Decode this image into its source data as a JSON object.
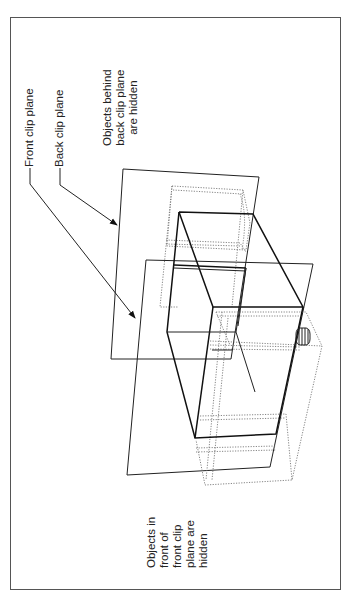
{
  "figure": {
    "labels": {
      "front_clip_plane": "Front clip plane",
      "back_clip_plane": "Back clip plane",
      "behind_note": [
        "Objects behind",
        "back clip plane",
        "are hidden"
      ],
      "front_note": [
        "Objects in",
        "front of",
        "front clip",
        "plane are",
        "hidden"
      ]
    },
    "colors": {
      "line": "#222222",
      "dotted": "#777777",
      "frame": "#555555",
      "background": "#ffffff"
    }
  }
}
